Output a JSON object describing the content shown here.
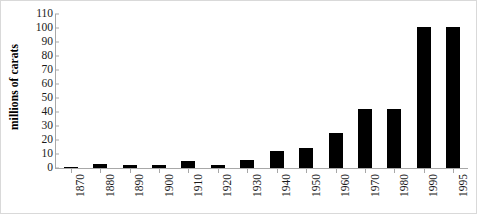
{
  "chart_data": {
    "type": "bar",
    "title": "",
    "subtitle": "",
    "xlabel": "",
    "ylabel": "millions of carats",
    "categories": [
      "1870",
      "1880",
      "1890",
      "1900",
      "1910",
      "1920",
      "1930",
      "1940",
      "1950",
      "1960",
      "1970",
      "1980",
      "1990",
      "1995"
    ],
    "values": [
      0.2,
      3,
      2,
      2,
      5,
      2.5,
      6,
      12,
      14,
      25,
      42,
      42,
      101,
      101
    ],
    "series": [
      {
        "name": "millions of carats",
        "values": [
          0.2,
          3,
          2,
          2,
          5,
          2.5,
          6,
          12,
          14,
          25,
          42,
          42,
          101,
          101
        ]
      }
    ],
    "ylim": [
      0,
      110
    ],
    "ytick_step": 10,
    "ytick_labels": [
      "0",
      "10",
      "20",
      "30",
      "40",
      "50",
      "60",
      "70",
      "80",
      "90",
      "100",
      "110"
    ],
    "grid": false,
    "legend": false,
    "legend_position": "none",
    "bar_color": "#000000",
    "axis_color": "#a8a8a8",
    "background_color": "#ffffff",
    "frame_color": "#d9d9d9",
    "xtick_rotation": -90
  }
}
